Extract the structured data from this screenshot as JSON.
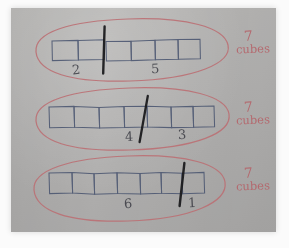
{
  "scene": {
    "medium": "photograph-of-handwritten-worksheet",
    "paper_color": "#b3b2b0",
    "pencil_color": "#4a5570",
    "marker_color": "#1b1b1e",
    "red_pen_color": "#b5646a"
  },
  "rows": [
    {
      "id": "row-1",
      "total_cubes": 7,
      "cubes_left_of_divider": 5,
      "left_label": "2",
      "right_label": "5",
      "divider_after_cube": 2,
      "note_count": "7",
      "note_word": "cubes"
    },
    {
      "id": "row-2",
      "total_cubes": 7,
      "cubes_left_of_divider": 4,
      "left_label": "4",
      "right_label": "3",
      "divider_after_cube": 4,
      "note_count": "7",
      "note_word": "cubes"
    },
    {
      "id": "row-3",
      "total_cubes": 7,
      "cubes_left_of_divider": 6,
      "left_label": "6",
      "right_label": "1",
      "divider_after_cube": 6,
      "note_count": "7",
      "note_word": "cubes"
    }
  ]
}
